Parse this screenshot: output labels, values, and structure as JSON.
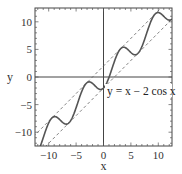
{
  "chart_data": {
    "type": "line",
    "title": "",
    "xlabel": "x",
    "ylabel": "y",
    "xlim": [
      -12.5,
      12.5
    ],
    "ylim": [
      -12.5,
      12.5
    ],
    "xticks": [
      -10,
      -5,
      0,
      5,
      10
    ],
    "yticks": [
      -10,
      -5,
      0,
      5,
      10
    ],
    "xtick_labels": [
      "−10",
      "−5",
      "0",
      "5",
      "10"
    ],
    "ytick_labels": [
      "−10",
      "−5",
      "0",
      "5",
      "10"
    ],
    "grid": false,
    "zero_axes": true,
    "series": [
      {
        "name": "y = x − 2 cos x",
        "style": "solid",
        "function": "x - 2*cos(x)",
        "color": "#555555",
        "width": 1.6
      },
      {
        "name": "y = x + 2",
        "style": "dashed",
        "function": "x + 2",
        "color": "#666666",
        "width": 0.8
      },
      {
        "name": "y = x − 2",
        "style": "dashed",
        "function": "x - 2",
        "color": "#666666",
        "width": 0.8
      }
    ],
    "sample_points": {
      "x": [
        -10,
        -8.5,
        -6.3,
        -5,
        -2.2,
        0,
        2,
        3.8,
        6.3,
        8,
        10,
        12.5
      ],
      "y": [
        -8.32,
        -7.28,
        -8.3,
        -5.57,
        -0.99,
        -2.0,
        2.83,
        5.39,
        4.3,
        8.29,
        11.68,
        10.5
      ]
    },
    "annotations": [
      {
        "text": "y = x − 2 cos x",
        "x": 0.5,
        "y": -2.9
      }
    ],
    "frame": {
      "left": 35,
      "right": 172,
      "top": 8,
      "bottom": 146
    }
  }
}
